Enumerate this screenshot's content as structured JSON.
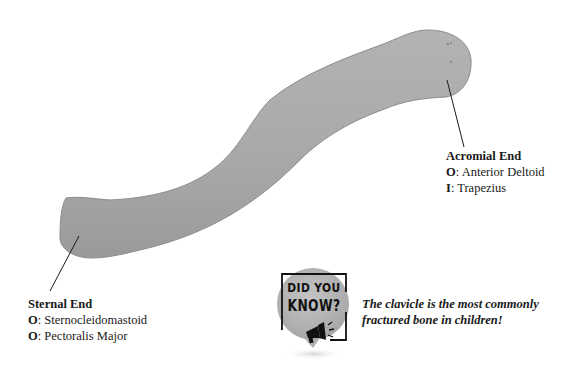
{
  "diagram": {
    "subject": "Clavicle",
    "colors": {
      "bone_fill": "#aaaaaa",
      "bone_edge": "#8a8a8a",
      "leader_line": "#1a1a1a",
      "badge_circle": "#b4b4b4",
      "badge_frame": "#111111"
    }
  },
  "labels": {
    "sternal": {
      "title": "Sternal End",
      "lines": [
        {
          "key": "O",
          "sep": ": ",
          "value": "Sternocleidomastoid"
        },
        {
          "key": "O",
          "sep": ": ",
          "value": "Pectoralis Major"
        }
      ]
    },
    "acromial": {
      "title": "Acromial End",
      "lines": [
        {
          "key": "O",
          "sep": ": ",
          "value": "Anterior Deltoid"
        },
        {
          "key": "I",
          "sep": ": ",
          "value": "Trapezius"
        }
      ]
    }
  },
  "callout": {
    "badge": {
      "line1": "DID YOU",
      "line2": "KNOW?",
      "icon": "megaphone-icon"
    },
    "fact": {
      "line1": "The clavicle is the most commonly",
      "line2": "fractured bone in children!"
    }
  }
}
